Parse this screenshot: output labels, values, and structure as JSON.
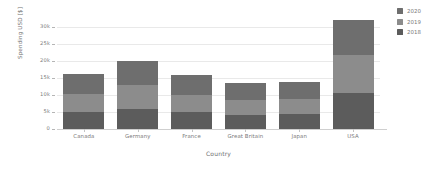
{
  "chart_data": {
    "type": "bar",
    "subtype": "stacked-vertical-bar",
    "title": "",
    "xlabel": "Country",
    "ylabel": "Spending USD [$]",
    "categories": [
      "Canada",
      "Germany",
      "France",
      "Great Britain",
      "Japan",
      "USA"
    ],
    "series": [
      {
        "name": "2018",
        "color": "#5c5c5c",
        "stack_position": "bottom",
        "values": [
          5000,
          6000,
          5000,
          4200,
          4400,
          10500
        ]
      },
      {
        "name": "2019",
        "color": "#8c8c8c",
        "stack_position": "middle",
        "values": [
          5300,
          6900,
          5100,
          4300,
          4500,
          11100
        ]
      },
      {
        "name": "2020",
        "color": "#6e6e6e",
        "stack_position": "top",
        "values": [
          5700,
          6900,
          5600,
          5100,
          5000,
          10400
        ]
      }
    ],
    "totals": [
      16000,
      19800,
      15700,
      13600,
      13900,
      32000
    ],
    "ylim": [
      0,
      32500
    ],
    "yticks": [
      0,
      5000,
      10000,
      15000,
      20000,
      25000,
      30000
    ],
    "ytick_labels": [
      "0",
      "5k",
      "10k",
      "15k",
      "20k",
      "25k",
      "30k"
    ],
    "grid": true,
    "grid_axis": "y",
    "legend_position": "right-top",
    "legend_entries": [
      "2020",
      "2019",
      "2018"
    ]
  },
  "axes": {
    "y_title": "Spending USD [$]",
    "x_title": "Country"
  },
  "colors": {
    "background": "#ffffff",
    "grid": "#e9e9e9",
    "axis": "#cfcfcf",
    "tick_text": "#7a7a7a",
    "label_text": "#6f6f6f",
    "series_2020": "#6e6e6e",
    "series_2019": "#8c8c8c",
    "series_2018": "#5c5c5c"
  }
}
